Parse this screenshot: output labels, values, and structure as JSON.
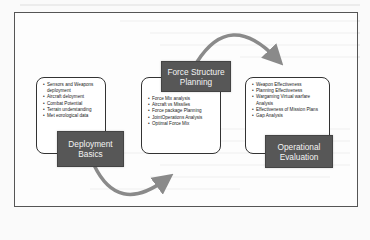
{
  "diagram": {
    "stages": [
      {
        "title_line1": "Deployment",
        "title_line2": "Basics",
        "items": [
          "Sensors and Weapons deployment",
          "Aircraft deloyment",
          "Combat Potential",
          "Terrain understanding",
          "Met eorological data"
        ]
      },
      {
        "title_line1": "Force Structure",
        "title_line2": "Planning",
        "items": [
          "Force Mix analysis",
          "Aircraft vs Missiles",
          "Force package Planning",
          "JointOperations Analysis",
          "Optimal Force Mix"
        ]
      },
      {
        "title_line1": "Operational",
        "title_line2": "Evaluation",
        "items": [
          "Weapon Effectiveness",
          "Planning Effectiveness",
          "Wargaming Virtual warfare Analysis",
          "Effectiveness of Mission Plans",
          "Gap Analysis"
        ]
      }
    ],
    "colors": {
      "title_fill": "#575757",
      "title_text": "#f4f4f4",
      "box_border": "#333333",
      "arrow": "#8a8a8a",
      "frame": "#555555"
    },
    "arrows": [
      {
        "from": "Force Structure Planning",
        "to": "Operational Evaluation"
      },
      {
        "from": "Deployment Basics",
        "to": "Force Structure Planning"
      }
    ]
  }
}
